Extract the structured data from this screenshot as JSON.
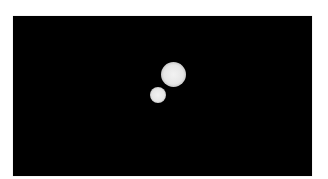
{
  "image": {
    "description": "Black frame containing two bright, soft-edged circular blobs",
    "background_color": "#000000",
    "page_color": "#ffffff",
    "objects": [
      {
        "name": "large-blob",
        "color": "#e6e6e6"
      },
      {
        "name": "small-blob",
        "color": "#e6e6e6"
      }
    ]
  }
}
